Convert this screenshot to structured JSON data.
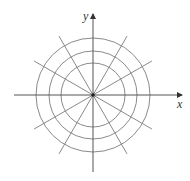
{
  "diagram": {
    "type": "polar-grid",
    "center": {
      "x": 93,
      "y": 95
    },
    "circle_radii": [
      32,
      44,
      57
    ],
    "radial_angles_deg": [
      30,
      60,
      120,
      150,
      210,
      240,
      300,
      330
    ],
    "radial_length": 68,
    "axes": {
      "x": {
        "label": "x",
        "from": 14,
        "to": 182
      },
      "y": {
        "label": "y",
        "from": 172,
        "to": 14
      }
    },
    "colors": {
      "grid": "#8a8a8a",
      "axis": "#555555",
      "center_dot": "#222222",
      "label": "#333333"
    }
  }
}
